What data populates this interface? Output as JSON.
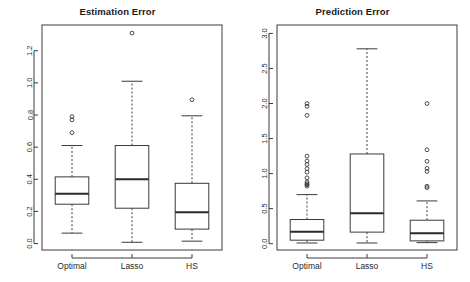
{
  "figure": {
    "background": "#ffffff",
    "line_color": "#3a3a3a",
    "width": 470,
    "height": 282
  },
  "panels": [
    {
      "id": "estimation",
      "title": "Estimation Error"
    },
    {
      "id": "prediction",
      "title": "Prediction Error"
    }
  ],
  "chart_data": [
    {
      "type": "box",
      "title": "Estimation Error",
      "xlabel": "",
      "ylabel": "",
      "categories": [
        "Optimal",
        "Lasso",
        "HS"
      ],
      "yticks": [
        0.0,
        0.2,
        0.4,
        0.6,
        0.8,
        1.0,
        1.2
      ],
      "ytick_labels": [
        "0.0",
        "0.2",
        "0.4",
        "0.6",
        "0.8",
        "1.0",
        "1.2"
      ],
      "ylim": [
        -0.04,
        1.36
      ],
      "grid": false,
      "legend": "none",
      "boxes": [
        {
          "name": "Optimal",
          "whisker_low": 0.065,
          "q1": 0.245,
          "median": 0.31,
          "q3": 0.415,
          "whisker_high": 0.61,
          "outliers": [
            0.69,
            0.77,
            0.79
          ]
        },
        {
          "name": "Lasso",
          "whisker_low": 0.008,
          "q1": 0.22,
          "median": 0.4,
          "q3": 0.61,
          "whisker_high": 1.01,
          "outliers": [
            1.31
          ]
        },
        {
          "name": "HS",
          "whisker_low": 0.015,
          "q1": 0.09,
          "median": 0.195,
          "q3": 0.375,
          "whisker_high": 0.795,
          "outliers": [
            0.895
          ]
        }
      ]
    },
    {
      "type": "box",
      "title": "Prediction Error",
      "xlabel": "",
      "ylabel": "",
      "categories": [
        "Optimal",
        "Lasso",
        "HS"
      ],
      "yticks": [
        0.0,
        0.5,
        1.0,
        1.5,
        2.0,
        2.5,
        3.0
      ],
      "ytick_labels": [
        "0.0",
        "0.5",
        "1.0",
        "1.5",
        "2.0",
        "2.5",
        "3.0"
      ],
      "ylim": [
        -0.09,
        3.12
      ],
      "grid": false,
      "legend": "none",
      "boxes": [
        {
          "name": "Optimal",
          "whisker_low": 0.01,
          "q1": 0.05,
          "median": 0.17,
          "q3": 0.345,
          "whisker_high": 0.7,
          "outliers": [
            0.82,
            0.84,
            0.855,
            0.88,
            0.94,
            1.02,
            1.07,
            1.13,
            1.18,
            1.25,
            1.83,
            1.96,
            2.0
          ]
        },
        {
          "name": "Lasso",
          "whisker_low": 0.01,
          "q1": 0.165,
          "median": 0.435,
          "q3": 1.28,
          "whisker_high": 2.78,
          "outliers": []
        },
        {
          "name": "HS",
          "whisker_low": 0.015,
          "q1": 0.04,
          "median": 0.15,
          "q3": 0.335,
          "whisker_high": 0.61,
          "outliers": [
            0.8,
            0.82,
            1.03,
            1.075,
            1.175,
            1.34,
            2.0
          ]
        }
      ]
    }
  ]
}
